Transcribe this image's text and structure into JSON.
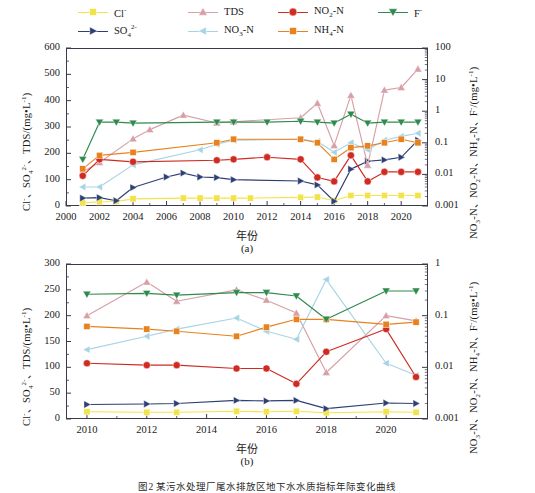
{
  "figure": {
    "caption": "图2 某污水处理厂尾水排放区地下水水质指标年际变化曲线",
    "panel_a_label": "(a)",
    "panel_b_label": "(b)",
    "xlabel": "年份",
    "left_axis_label": "Cl⁻、SO₄²⁻、TDS/(mg•L⁻¹)",
    "right_axis_label": "NO₃-N、NO₂-N、NH₄-N、F⁻/(mg•L⁻¹)"
  },
  "legend": {
    "items": [
      {
        "label": "Cl-",
        "display": "Cl",
        "sup": "-",
        "sub": "",
        "color": "#f2e34a",
        "marker": "square",
        "axis": "left"
      },
      {
        "label": "TDS",
        "display": "TDS",
        "sup": "",
        "sub": "",
        "color": "#d7a0a6",
        "marker": "triangle-up",
        "axis": "left"
      },
      {
        "label": "NO2-N",
        "display": "NO",
        "sup": "",
        "sub": "2",
        "tail": "-N",
        "color": "#cf2b22",
        "marker": "circle",
        "axis": "right"
      },
      {
        "label": "F-",
        "display": "F",
        "sup": "-",
        "sub": "",
        "color": "#2f8a4e",
        "marker": "triangle-down",
        "axis": "right"
      },
      {
        "label": "SO42-",
        "display": "SO",
        "sup": "2-",
        "sub": "4",
        "color": "#2e3f73",
        "marker": "triangle-right",
        "axis": "left"
      },
      {
        "label": "NO3-N",
        "display": "NO",
        "sup": "",
        "sub": "3",
        "tail": "-N",
        "color": "#a7d4e4",
        "marker": "triangle-left",
        "axis": "right"
      },
      {
        "label": "NH4-N",
        "display": "NH",
        "sup": "",
        "sub": "4",
        "tail": "-N",
        "color": "#e8821e",
        "marker": "square",
        "axis": "right"
      }
    ]
  },
  "chart_data": [
    {
      "type": "line",
      "panel": "(a)",
      "title": "",
      "xlabel": "年份",
      "ylabel": "Cl⁻、SO₄²⁻、TDS/(mg•L⁻¹)",
      "y2label": "NO₃-N、NO₂-N、NH₄-N、F⁻/(mg•L⁻¹)",
      "xlim": [
        2000,
        2021.6
      ],
      "ylim": [
        0,
        600
      ],
      "yticks": [
        0,
        100,
        200,
        300,
        400,
        500,
        600
      ],
      "y2lim": [
        0.001,
        100
      ],
      "y2scale": "log",
      "y2ticks": [
        0.001,
        0.01,
        0.1,
        1,
        10,
        100
      ],
      "xticks": [
        2000,
        2002,
        2004,
        2006,
        2008,
        2010,
        2012,
        2014,
        2016,
        2018,
        2020
      ],
      "grid": false,
      "legend_position": "above-plot",
      "series": [
        {
          "name": "Cl-",
          "axis": "left",
          "color": "#f2e34a",
          "x": [
            2001,
            2002,
            2003,
            2004,
            2007,
            2008,
            2009,
            2010,
            2011,
            2014,
            2015,
            2016,
            2017,
            2018,
            2019,
            2020,
            2021
          ],
          "y": [
            12,
            16,
            17,
            27,
            30,
            30,
            30,
            30,
            30,
            33,
            34,
            20,
            40,
            40,
            40,
            40,
            40
          ]
        },
        {
          "name": "SO42-",
          "axis": "left",
          "color": "#2e3f73",
          "x": [
            2001,
            2002,
            2003,
            2004,
            2006,
            2007,
            2008,
            2009,
            2010,
            2014,
            2015,
            2016,
            2017,
            2018,
            2019,
            2020,
            2021
          ],
          "y": [
            30,
            32,
            20,
            70,
            110,
            125,
            110,
            108,
            100,
            95,
            80,
            18,
            140,
            170,
            175,
            185,
            250
          ]
        },
        {
          "name": "TDS",
          "axis": "left",
          "color": "#d7a0a6",
          "x": [
            2001,
            2002,
            2004,
            2005,
            2007,
            2009,
            2010,
            2014,
            2015,
            2016,
            2017,
            2018,
            2019,
            2020,
            2021
          ],
          "y": [
            130,
            165,
            255,
            290,
            345,
            315,
            320,
            335,
            390,
            230,
            420,
            155,
            440,
            450,
            520
          ]
        },
        {
          "name": "NO3-N",
          "axis": "right",
          "color": "#a7d4e4",
          "x": [
            2001,
            2002,
            2004,
            2008,
            2009,
            2010,
            2014,
            2015,
            2016,
            2017,
            2018,
            2019,
            2020,
            2021
          ],
          "y": [
            0.004,
            0.004,
            0.02,
            0.06,
            0.09,
            0.12,
            0.13,
            0.11,
            0.05,
            0.1,
            0.06,
            0.12,
            0.16,
            0.2
          ]
        },
        {
          "name": "NO2-N",
          "axis": "right",
          "color": "#cf2b22",
          "x": [
            2001,
            2002,
            2004,
            2009,
            2010,
            2012,
            2014,
            2015,
            2016,
            2017,
            2018,
            2019,
            2020,
            2021
          ],
          "y": [
            0.009,
            0.03,
            0.025,
            0.028,
            0.03,
            0.035,
            0.03,
            0.008,
            0.006,
            0.04,
            0.006,
            0.012,
            0.012,
            0.012
          ]
        },
        {
          "name": "NH4-N",
          "axis": "right",
          "color": "#e8821e",
          "x": [
            2001,
            2002,
            2004,
            2009,
            2010,
            2014,
            2015,
            2016,
            2017,
            2018,
            2019,
            2020,
            2021
          ],
          "y": [
            0.015,
            0.04,
            0.05,
            0.1,
            0.13,
            0.13,
            0.1,
            0.03,
            0.07,
            0.08,
            0.1,
            0.13,
            0.1
          ]
        },
        {
          "name": "F-",
          "axis": "right",
          "color": "#2f8a4e",
          "x": [
            2001,
            2002,
            2003,
            2004,
            2009,
            2010,
            2012,
            2014,
            2015,
            2016,
            2017,
            2018,
            2019,
            2020,
            2021
          ],
          "y": [
            0.03,
            0.45,
            0.45,
            0.42,
            0.45,
            0.45,
            0.45,
            0.48,
            0.45,
            0.42,
            0.8,
            0.42,
            0.45,
            0.45,
            0.45
          ]
        }
      ]
    },
    {
      "type": "line",
      "panel": "(b)",
      "title": "",
      "xlabel": "年份",
      "ylabel": "Cl⁻、SO₄²⁻、TDS/(mg•L⁻¹)",
      "y2label": "NO₃-N、NO₂-N、NH₄-N、F⁻/(mg•L⁻¹)",
      "xlim": [
        2009.3,
        2021.4
      ],
      "ylim": [
        0,
        300
      ],
      "yticks": [
        0,
        50,
        100,
        150,
        200,
        250,
        300
      ],
      "y2lim": [
        0.001,
        1
      ],
      "y2scale": "log",
      "y2ticks": [
        0.001,
        0.01,
        0.1,
        1
      ],
      "xticks": [
        2010,
        2012,
        2014,
        2016,
        2018,
        2020
      ],
      "grid": false,
      "legend_position": "shared-with-panel-a",
      "series": [
        {
          "name": "Cl-",
          "axis": "left",
          "color": "#f2e34a",
          "x": [
            2010,
            2012,
            2013,
            2015,
            2016,
            2017,
            2018,
            2020,
            2021
          ],
          "y": [
            14,
            13,
            13,
            15,
            14,
            15,
            12,
            14,
            13
          ]
        },
        {
          "name": "SO42-",
          "axis": "left",
          "color": "#2e3f73",
          "x": [
            2010,
            2012,
            2013,
            2015,
            2016,
            2017,
            2018,
            2020,
            2021
          ],
          "y": [
            28,
            29,
            30,
            36,
            35,
            36,
            20,
            31,
            30
          ]
        },
        {
          "name": "TDS",
          "axis": "left",
          "color": "#d7a0a6",
          "x": [
            2010,
            2012,
            2013,
            2015,
            2016,
            2017,
            2018,
            2020,
            2021
          ],
          "y": [
            200,
            265,
            228,
            250,
            230,
            205,
            90,
            200,
            190
          ]
        },
        {
          "name": "NO3-N",
          "axis": "right",
          "color": "#a7d4e4",
          "x": [
            2010,
            2012,
            2013,
            2015,
            2016,
            2017,
            2018,
            2020,
            2021
          ],
          "y": [
            0.022,
            0.04,
            0.055,
            0.09,
            0.05,
            0.035,
            0.5,
            0.012,
            0.007
          ]
        },
        {
          "name": "NO2-N",
          "axis": "right",
          "color": "#cf2b22",
          "x": [
            2010,
            2012,
            2013,
            2015,
            2016,
            2017,
            2018,
            2020,
            2021
          ],
          "y": [
            0.012,
            0.011,
            0.011,
            0.0095,
            0.0095,
            0.0048,
            0.02,
            0.055,
            0.0065
          ]
        },
        {
          "name": "NH4-N",
          "axis": "right",
          "color": "#e8821e",
          "x": [
            2010,
            2012,
            2013,
            2015,
            2016,
            2017,
            2018,
            2020,
            2021
          ],
          "y": [
            0.062,
            0.055,
            0.05,
            0.04,
            0.06,
            0.085,
            0.085,
            0.068,
            0.075
          ]
        },
        {
          "name": "F-",
          "axis": "right",
          "color": "#2f8a4e",
          "x": [
            2010,
            2012,
            2013,
            2015,
            2016,
            2017,
            2018,
            2020,
            2021
          ],
          "y": [
            0.26,
            0.27,
            0.25,
            0.28,
            0.28,
            0.24,
            0.085,
            0.3,
            0.3
          ]
        }
      ]
    }
  ]
}
